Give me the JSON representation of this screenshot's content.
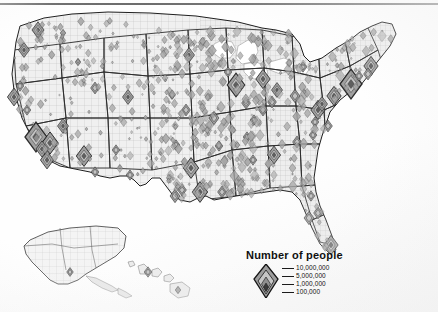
{
  "map": {
    "title_visible": false,
    "subject": "United States population by county",
    "symbol_type": "graduated-diamond",
    "insets": [
      "Alaska",
      "Hawaii"
    ],
    "background_color": "#ffffff",
    "land_fill": "#f2f2f2",
    "county_line_color": "#b4b4b4",
    "state_line_color": "#2b2b2b",
    "symbol_fill": "#9a9a9a",
    "symbol_stroke": "#1c1c1c"
  },
  "legend": {
    "title": "Number of people",
    "entries": [
      {
        "value": "10,000,000"
      },
      {
        "value": "5,000,000"
      },
      {
        "value": "1,000,000"
      },
      {
        "value": "100,000"
      }
    ]
  },
  "chart_data": {
    "type": "map",
    "title": "Number of people",
    "symbol": "nested diamond, area-proportional",
    "breaks": [
      10000000,
      5000000,
      1000000,
      100000
    ],
    "break_labels": [
      "10,000,000",
      "5,000,000",
      "1,000,000",
      "100,000"
    ],
    "symbols": [
      {
        "name": "Seattle",
        "x": 38,
        "y": 30,
        "size": 11
      },
      {
        "name": "Portland",
        "x": 24,
        "y": 50,
        "size": 10
      },
      {
        "name": "Spokane",
        "x": 63,
        "y": 33,
        "size": 5
      },
      {
        "name": "Boise",
        "x": 78,
        "y": 62,
        "size": 5
      },
      {
        "name": "Salt Lake City",
        "x": 95,
        "y": 88,
        "size": 8
      },
      {
        "name": "Denver",
        "x": 128,
        "y": 97,
        "size": 10
      },
      {
        "name": "Sacramento",
        "x": 20,
        "y": 86,
        "size": 7
      },
      {
        "name": "San Francisco Bay",
        "x": 14,
        "y": 97,
        "size": 12
      },
      {
        "name": "Fresno",
        "x": 27,
        "y": 110,
        "size": 7
      },
      {
        "name": "Los Angeles",
        "x": 36,
        "y": 137,
        "size": 20
      },
      {
        "name": "Riverside",
        "x": 50,
        "y": 143,
        "size": 15
      },
      {
        "name": "San Diego",
        "x": 47,
        "y": 160,
        "size": 12
      },
      {
        "name": "Orange County",
        "x": 42,
        "y": 149,
        "size": 11
      },
      {
        "name": "Las Vegas",
        "x": 63,
        "y": 126,
        "size": 10
      },
      {
        "name": "Phoenix",
        "x": 84,
        "y": 156,
        "size": 14
      },
      {
        "name": "Tucson",
        "x": 95,
        "y": 172,
        "size": 7
      },
      {
        "name": "Albuquerque",
        "x": 116,
        "y": 150,
        "size": 7
      },
      {
        "name": "El Paso",
        "x": 130,
        "y": 175,
        "size": 7
      },
      {
        "name": "Oklahoma City",
        "x": 176,
        "y": 145,
        "size": 7
      },
      {
        "name": "Dallas",
        "x": 191,
        "y": 168,
        "size": 14
      },
      {
        "name": "Austin",
        "x": 182,
        "y": 190,
        "size": 8
      },
      {
        "name": "San Antonio",
        "x": 175,
        "y": 196,
        "size": 9
      },
      {
        "name": "Houston",
        "x": 200,
        "y": 192,
        "size": 14
      },
      {
        "name": "Kansas City",
        "x": 186,
        "y": 110,
        "size": 8
      },
      {
        "name": "Minneapolis",
        "x": 189,
        "y": 55,
        "size": 10
      },
      {
        "name": "Omaha",
        "x": 172,
        "y": 95,
        "size": 6
      },
      {
        "name": "St. Louis",
        "x": 214,
        "y": 118,
        "size": 9
      },
      {
        "name": "Chicago",
        "x": 236,
        "y": 85,
        "size": 16
      },
      {
        "name": "Milwaukee",
        "x": 228,
        "y": 72,
        "size": 7
      },
      {
        "name": "Detroit",
        "x": 263,
        "y": 79,
        "size": 13
      },
      {
        "name": "Cleveland",
        "x": 277,
        "y": 90,
        "size": 10
      },
      {
        "name": "Columbus",
        "x": 272,
        "y": 102,
        "size": 8
      },
      {
        "name": "Cincinnati",
        "x": 263,
        "y": 110,
        "size": 8
      },
      {
        "name": "Indianapolis",
        "x": 246,
        "y": 103,
        "size": 8
      },
      {
        "name": "Nashville",
        "x": 247,
        "y": 137,
        "size": 7
      },
      {
        "name": "Memphis",
        "x": 219,
        "y": 146,
        "size": 7
      },
      {
        "name": "New Orleans",
        "x": 222,
        "y": 192,
        "size": 8
      },
      {
        "name": "Atlanta",
        "x": 274,
        "y": 155,
        "size": 12
      },
      {
        "name": "Charlotte",
        "x": 297,
        "y": 142,
        "size": 8
      },
      {
        "name": "Raleigh",
        "x": 313,
        "y": 135,
        "size": 7
      },
      {
        "name": "Washington DC",
        "x": 318,
        "y": 110,
        "size": 13
      },
      {
        "name": "Baltimore",
        "x": 322,
        "y": 104,
        "size": 10
      },
      {
        "name": "Philadelphia",
        "x": 334,
        "y": 96,
        "size": 13
      },
      {
        "name": "New York",
        "x": 351,
        "y": 84,
        "size": 20
      },
      {
        "name": "Boston",
        "x": 371,
        "y": 66,
        "size": 13
      },
      {
        "name": "Providence",
        "x": 368,
        "y": 74,
        "size": 8
      },
      {
        "name": "Hartford",
        "x": 359,
        "y": 76,
        "size": 7
      },
      {
        "name": "Pittsburgh",
        "x": 295,
        "y": 96,
        "size": 9
      },
      {
        "name": "Buffalo",
        "x": 303,
        "y": 67,
        "size": 7
      },
      {
        "name": "Richmond",
        "x": 315,
        "y": 122,
        "size": 7
      },
      {
        "name": "Virginia Beach",
        "x": 328,
        "y": 126,
        "size": 8
      },
      {
        "name": "Jacksonville",
        "x": 311,
        "y": 196,
        "size": 7
      },
      {
        "name": "Orlando",
        "x": 318,
        "y": 213,
        "size": 8
      },
      {
        "name": "Tampa",
        "x": 309,
        "y": 218,
        "size": 9
      },
      {
        "name": "Miami",
        "x": 331,
        "y": 245,
        "size": 13
      },
      {
        "name": "Birmingham",
        "x": 253,
        "y": 160,
        "size": 7
      },
      {
        "name": "Louisville",
        "x": 254,
        "y": 120,
        "size": 7
      },
      {
        "name": "Anchorage",
        "x": 70,
        "y": 272,
        "size": 6
      },
      {
        "name": "Honolulu",
        "x": 148,
        "y": 272,
        "size": 7
      },
      {
        "name": "Hawaii Island",
        "x": 178,
        "y": 290,
        "size": 5
      }
    ]
  }
}
